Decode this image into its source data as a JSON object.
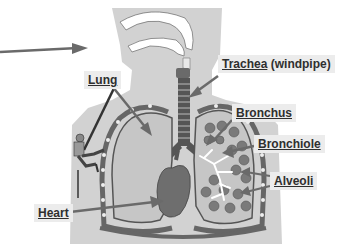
{
  "diagram": {
    "labels": {
      "trachea": "Trachea",
      "trachea_note": "(windpipe)",
      "lung": "Lung",
      "bronchus": "Bronchus",
      "bronchiole": "Bronchiole",
      "alveoli": "Alveoli",
      "heart": "Heart"
    },
    "colors": {
      "body": "#d0d0d0",
      "lung_fill": "#c4c4c4",
      "lung_outline": "#555555",
      "alveoli": "#7a7a7a",
      "heart": "#6e6e6e",
      "trachea": "#555555",
      "label_bg": "#ececec",
      "text": "#2f2f2f"
    }
  }
}
